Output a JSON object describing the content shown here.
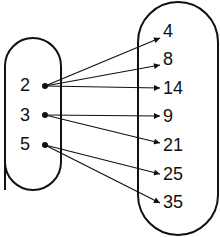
{
  "diagram": {
    "type": "mapping",
    "domain": [
      "2",
      "3",
      "5"
    ],
    "codomain": [
      "4",
      "8",
      "14",
      "9",
      "21",
      "25",
      "35"
    ],
    "arrows": [
      {
        "from": "2",
        "to": "4"
      },
      {
        "from": "2",
        "to": "8"
      },
      {
        "from": "2",
        "to": "14"
      },
      {
        "from": "3",
        "to": "9"
      },
      {
        "from": "3",
        "to": "21"
      },
      {
        "from": "5",
        "to": "25"
      },
      {
        "from": "5",
        "to": "35"
      }
    ],
    "colors": {
      "stroke": "#111111",
      "background": "#ffffff"
    }
  }
}
